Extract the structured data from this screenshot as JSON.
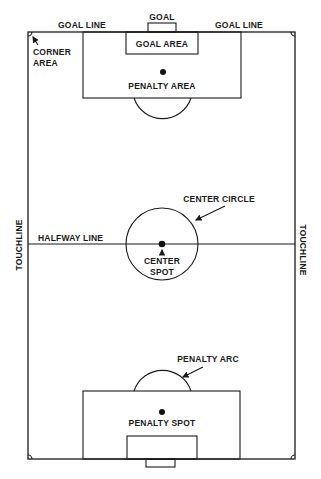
{
  "diagram": {
    "type": "soccer-field-layout",
    "labels": {
      "goal_top": "GOAL",
      "goal_line_left": "GOAL LINE",
      "goal_line_right": "GOAL LINE",
      "corner_area_line1": "CORNER",
      "corner_area_line2": "AREA",
      "goal_area": "GOAL AREA",
      "penalty_area": "PENALTY AREA",
      "center_circle": "CENTER CIRCLE",
      "halfway_line": "HALFWAY LINE",
      "center_spot_line1": "CENTER",
      "center_spot_line2": "SPOT",
      "touchline_left": "TOUCHLINE",
      "touchline_right": "TOUCHLINE",
      "penalty_arc": "PENALTY ARC",
      "penalty_spot": "PENALTY SPOT"
    },
    "colors": {
      "line": "#1a1a1a",
      "background": "#ffffff"
    }
  }
}
